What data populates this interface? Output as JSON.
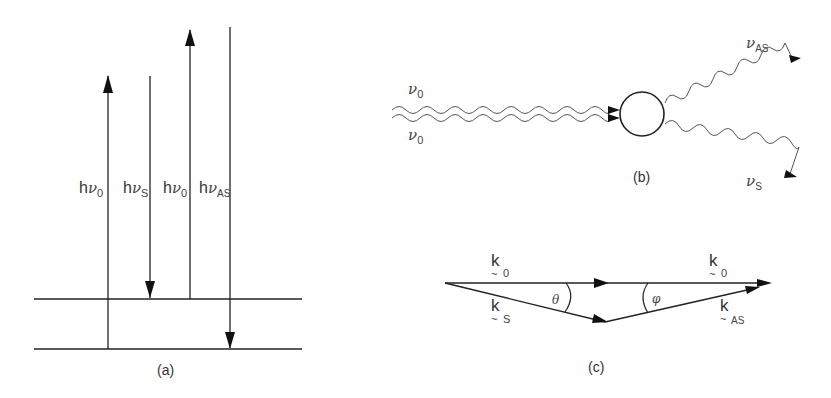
{
  "figure": {
    "panel_a": {
      "caption": "(a)",
      "transitions": [
        {
          "label_prefix": "h",
          "symbol": "ν",
          "subscript": "0",
          "direction": "up"
        },
        {
          "label_prefix": "h",
          "symbol": "ν",
          "subscript": "S",
          "direction": "down"
        },
        {
          "label_prefix": "h",
          "symbol": "ν",
          "subscript": "0",
          "direction": "up"
        },
        {
          "label_prefix": "h",
          "symbol": "ν",
          "subscript": "AS",
          "direction": "down"
        }
      ],
      "levels": 2
    },
    "panel_b": {
      "caption": "(b)",
      "incoming": [
        {
          "symbol": "ν",
          "subscript": "0"
        },
        {
          "symbol": "ν",
          "subscript": "0"
        }
      ],
      "outgoing": [
        {
          "symbol": "ν",
          "subscript": "AS"
        },
        {
          "symbol": "ν",
          "subscript": "S"
        }
      ]
    },
    "panel_c": {
      "caption": "(c)",
      "vectors": [
        {
          "symbol": "k",
          "tilde": "~",
          "subscript": "0"
        },
        {
          "symbol": "k",
          "tilde": "~",
          "subscript": "0"
        },
        {
          "symbol": "k",
          "tilde": "~",
          "subscript": "S"
        },
        {
          "symbol": "k",
          "tilde": "~",
          "subscript": "AS"
        }
      ],
      "angles": [
        {
          "symbol": "θ"
        },
        {
          "symbol": "φ"
        }
      ]
    }
  }
}
